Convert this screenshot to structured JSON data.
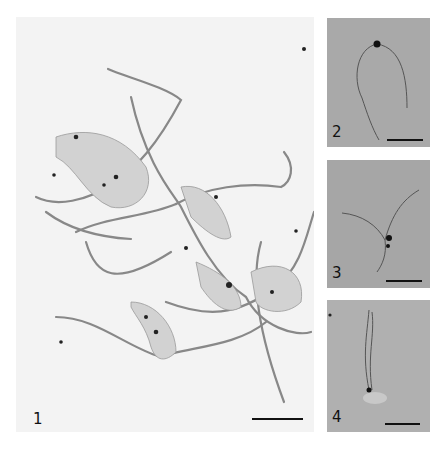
{
  "figure": {
    "panels": [
      {
        "id": "1",
        "label": "1",
        "description": "Negatively stained spiral bacteria with multiple sheathed flagella (electron micrograph)",
        "scale_bar": true
      },
      {
        "id": "2",
        "label": "2",
        "description": "Single cell with looped flagellum",
        "scale_bar": true
      },
      {
        "id": "3",
        "label": "3",
        "description": "Cell with branching flagella",
        "scale_bar": true
      },
      {
        "id": "4",
        "label": "4",
        "description": "Cell with twisted flagellar bundle",
        "scale_bar": true
      }
    ],
    "colors": {
      "background": "#ffffff",
      "panel1_bg": "#f3f3f3",
      "panel_gray": "#a9a9a9",
      "ink": "#111111"
    }
  }
}
